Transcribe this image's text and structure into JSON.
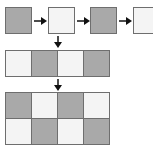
{
  "diagram": {
    "colors": {
      "dark": "#a9a9a9",
      "light": "#f4f4f4",
      "border": "#6e6e6e",
      "arrow": "#111111"
    },
    "top_sequence": [
      "dark",
      "light",
      "dark",
      "light"
    ],
    "middle_row": [
      "light",
      "dark",
      "light",
      "dark"
    ],
    "bottom_grid": [
      [
        "dark",
        "light",
        "dark",
        "light"
      ],
      [
        "light",
        "dark",
        "light",
        "dark"
      ]
    ]
  }
}
